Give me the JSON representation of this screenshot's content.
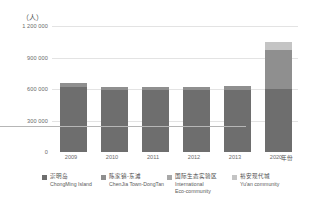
{
  "chart_data": {
    "type": "bar",
    "title": "",
    "subtitle": "",
    "xlabel": "年份",
    "ylabel": "（人）",
    "y_unit_label": "（人）",
    "stacked": true,
    "grid": true,
    "legend_position": "bottom",
    "categories": [
      "2009",
      "2010",
      "2011",
      "2012",
      "2013",
      "2020"
    ],
    "ylim": [
      0,
      1200000
    ],
    "yticks": [
      0,
      300000,
      600000,
      900000,
      1200000
    ],
    "ytick_labels": [
      "0",
      "300 000",
      "600 000",
      "900 000",
      "1 200 000"
    ],
    "series": [
      {
        "name": "崇明岛",
        "name_en": "ChongMing Island",
        "color": "#6e6e6e",
        "values": [
          620000,
          590000,
          590000,
          590000,
          595000,
          600000
        ]
      },
      {
        "name": "陈家镇-东滩",
        "name_en": "ChenJia Town-DongTan",
        "color": "#8f8f8f",
        "values": [
          40000,
          30000,
          30000,
          30000,
          35000,
          370000
        ]
      },
      {
        "name": "国际生态实验区",
        "name_en": "International Eco-community",
        "color": "#a8a8a8",
        "values": [
          0,
          0,
          0,
          0,
          0,
          0
        ]
      },
      {
        "name": "裕安现代城",
        "name_en": "Yu'an community",
        "color": "#c4c4c4",
        "values": [
          0,
          0,
          0,
          0,
          0,
          80000
        ]
      }
    ],
    "totals": [
      660000,
      620000,
      620000,
      620000,
      630000,
      1050000
    ]
  },
  "axes": {
    "y_unit": "（人）",
    "x_title": "年份",
    "ytick_labels": [
      "1 200 000",
      "900 000",
      "600 000",
      "300 000",
      "0"
    ],
    "xtick_labels": [
      "2009",
      "2010",
      "2011",
      "2012",
      "2013",
      "2020"
    ]
  },
  "legend": {
    "items": [
      {
        "cn": "崇明岛",
        "en": "ChongMing Island",
        "en2": "",
        "color": "#6e6e6e"
      },
      {
        "cn": "陈家镇-东滩",
        "en": "ChenJia Town-DongTan",
        "en2": "",
        "color": "#8f8f8f"
      },
      {
        "cn": "国际生态实验区",
        "en": "International",
        "en2": "Eco-community",
        "color": "#a8a8a8"
      },
      {
        "cn": "裕安现代城",
        "en": "Yu'an community",
        "en2": "",
        "color": "#c4c4c4"
      }
    ]
  },
  "colors": {
    "gridline": "#e3e3e3",
    "axis": "#b6b6b6",
    "text": "#5a5a5a",
    "background": "#ffffff"
  }
}
